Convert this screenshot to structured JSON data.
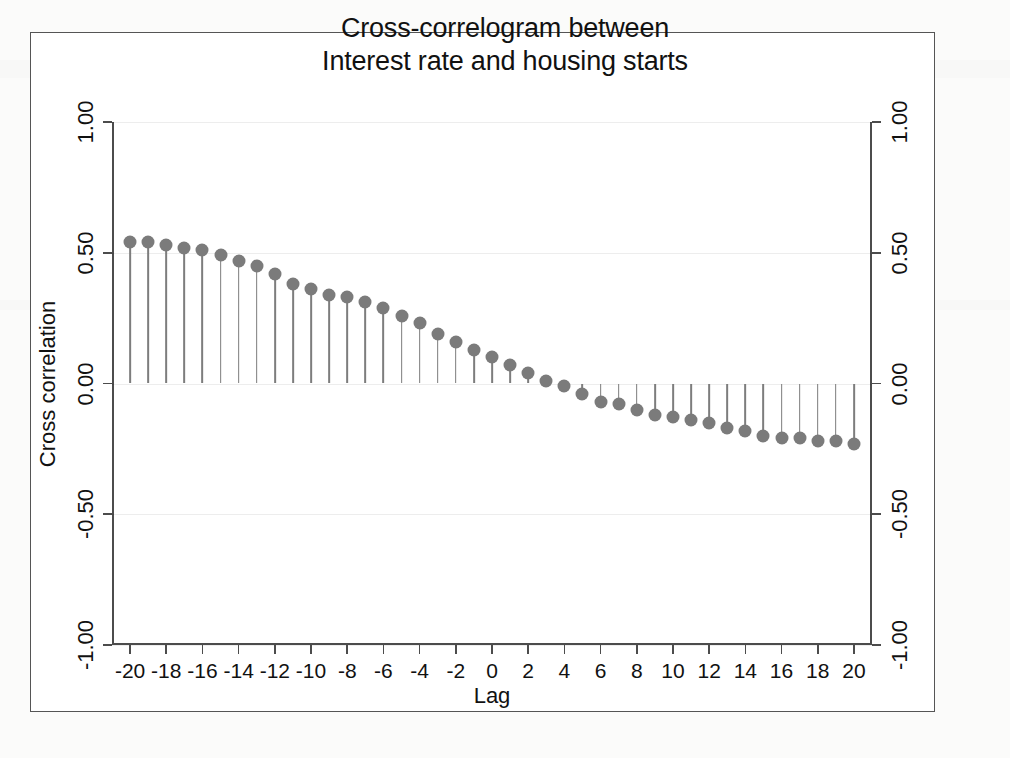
{
  "figure": {
    "title_line1": "Cross-correlogram between",
    "title_line2": "Interest rate and housing starts",
    "marker_color": "#7b7b7b",
    "stem_color": "#7d7d7d",
    "axis_color": "#4c4c4c",
    "background_color": "#ffffff"
  },
  "chart_data": {
    "type": "bar",
    "subtype": "stem-correlogram",
    "title": "Cross-correlogram between Interest rate and housing starts",
    "xlabel": "Lag",
    "ylabel": "Cross correlation",
    "xlim": [
      -21,
      21
    ],
    "ylim": [
      -1.0,
      1.0
    ],
    "grid": false,
    "legend": null,
    "y_ticks": [
      1.0,
      0.5,
      0.0,
      -0.5,
      -1.0
    ],
    "y_tick_labels": [
      "1.00",
      "0.50",
      "0.00",
      "-0.50",
      "-1.00"
    ],
    "y_tick_labels_right": [
      "1.00",
      "0.50",
      "0.00",
      "-0.50",
      "-1.00"
    ],
    "x_ticks": [
      -20,
      -18,
      -16,
      -14,
      -12,
      -10,
      -8,
      -6,
      -4,
      -2,
      0,
      2,
      4,
      6,
      8,
      10,
      12,
      14,
      16,
      18,
      20
    ],
    "x_tick_labels": [
      "-20",
      "-18",
      "-16",
      "-14",
      "-12",
      "-10",
      "-8",
      "-6",
      "-4",
      "-2",
      "0",
      "2",
      "4",
      "6",
      "8",
      "10",
      "12",
      "14",
      "16",
      "18",
      "20"
    ],
    "categories": [
      -20,
      -19,
      -18,
      -17,
      -16,
      -15,
      -14,
      -13,
      -12,
      -11,
      -10,
      -9,
      -8,
      -7,
      -6,
      -5,
      -4,
      -3,
      -2,
      -1,
      0,
      1,
      2,
      3,
      4,
      5,
      6,
      7,
      8,
      9,
      10,
      11,
      12,
      13,
      14,
      15,
      16,
      17,
      18,
      19,
      20
    ],
    "values": [
      0.54,
      0.54,
      0.53,
      0.52,
      0.51,
      0.49,
      0.47,
      0.45,
      0.42,
      0.38,
      0.36,
      0.34,
      0.33,
      0.31,
      0.29,
      0.26,
      0.23,
      0.19,
      0.16,
      0.13,
      0.1,
      0.07,
      0.04,
      0.01,
      -0.01,
      -0.04,
      -0.07,
      -0.08,
      -0.1,
      -0.12,
      -0.13,
      -0.14,
      -0.15,
      -0.17,
      -0.18,
      -0.2,
      -0.21,
      -0.21,
      -0.22,
      -0.22,
      -0.23
    ]
  }
}
